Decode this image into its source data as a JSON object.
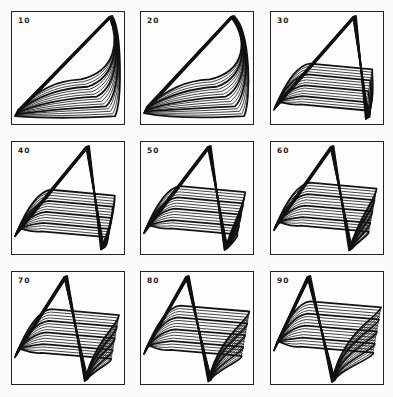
{
  "figure": {
    "panels": [
      {
        "label": "10",
        "shape": 0.0
      },
      {
        "label": "20",
        "shape": 0.12
      },
      {
        "label": "30",
        "shape": 0.25
      },
      {
        "label": "40",
        "shape": 0.38
      },
      {
        "label": "50",
        "shape": 0.5
      },
      {
        "label": "60",
        "shape": 0.62
      },
      {
        "label": "70",
        "shape": 0.74
      },
      {
        "label": "80",
        "shape": 0.86
      },
      {
        "label": "90",
        "shape": 1.0
      }
    ],
    "colors": {
      "line": "#111111",
      "border": "#222222",
      "background": "#fbfbfb"
    }
  }
}
